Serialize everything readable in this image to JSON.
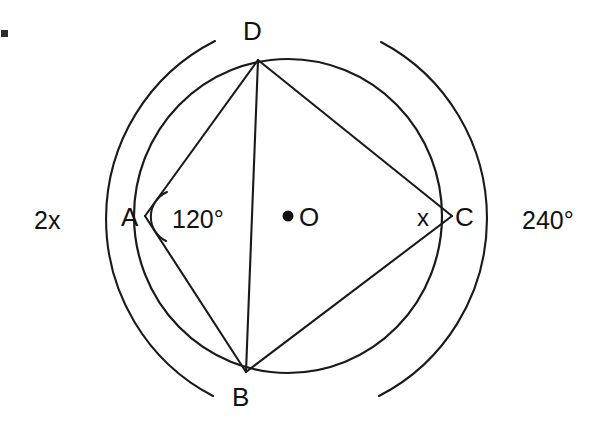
{
  "figure": {
    "background_color": "#ffffff",
    "stroke_color": "#1a1a1a",
    "vertices": [
      {
        "id": "A",
        "label": "A",
        "x": 145,
        "y": 216,
        "label_x": 121,
        "label_y": 226
      },
      {
        "id": "B",
        "label": "B",
        "x": 246,
        "y": 372,
        "label_x": 232,
        "label_y": 406
      },
      {
        "id": "C",
        "label": "C",
        "x": 452,
        "y": 216,
        "label_x": 455,
        "label_y": 226
      },
      {
        "id": "D",
        "label": "D",
        "x": 258,
        "y": 60,
        "label_x": 243,
        "label_y": 40
      }
    ],
    "centre": {
      "id": "O",
      "label": "O",
      "x": 288,
      "y": 216,
      "dot_radius": 5,
      "label_x": 299,
      "label_y": 226
    },
    "angle_labels": [
      {
        "id": "angle-A",
        "text": "120°",
        "x": 172,
        "y": 228
      },
      {
        "id": "angle-C",
        "text": "x",
        "x": 417,
        "y": 226
      }
    ],
    "arc_labels": [
      {
        "id": "arc-left",
        "text": "2x",
        "x": 34,
        "y": 229
      },
      {
        "id": "arc-right",
        "text": "240°",
        "x": 522,
        "y": 229
      }
    ],
    "chords": [
      {
        "id": "chord-AD",
        "from": "A",
        "to": "D"
      },
      {
        "id": "chord-DC",
        "from": "D",
        "to": "C"
      },
      {
        "id": "chord-CB",
        "from": "C",
        "to": "B"
      },
      {
        "id": "chord-BA",
        "from": "B",
        "to": "A"
      },
      {
        "id": "diagonal-DB",
        "from": "D",
        "to": "B"
      }
    ],
    "main_circle": {
      "cx": 288,
      "cy": 216,
      "rx": 154,
      "ry": 157
    },
    "outer_arcs": [
      {
        "id": "outer-arc-left",
        "label_ref": "2x"
      },
      {
        "id": "outer-arc-right",
        "label_ref": "240°"
      }
    ],
    "corner_mark": {
      "x": 1,
      "y": 30,
      "size": 7
    }
  }
}
